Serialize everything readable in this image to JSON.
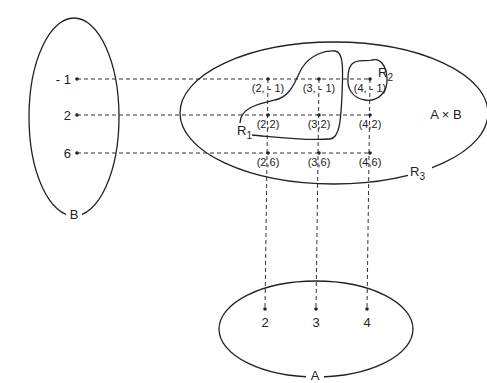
{
  "sets": {
    "B": {
      "label": "B",
      "elements": [
        "- 1",
        "2",
        "6"
      ]
    },
    "A": {
      "label": "A",
      "elements": [
        "2",
        "3",
        "4"
      ]
    },
    "AxB": {
      "label": "A × B"
    }
  },
  "pairs": {
    "row_neg1": [
      "(2, - 1)",
      "(3, - 1)",
      "(4, - 1)"
    ],
    "row_2": [
      "(2,2)",
      "(3,2)",
      "(4,2)"
    ],
    "row_6": [
      "(2,6)",
      "(3,6)",
      "(4,6)"
    ]
  },
  "relations": {
    "R1": {
      "main": "R",
      "sub": "1"
    },
    "R2": {
      "main": "R",
      "sub": "2"
    },
    "R3": {
      "main": "R",
      "sub": "3"
    }
  }
}
